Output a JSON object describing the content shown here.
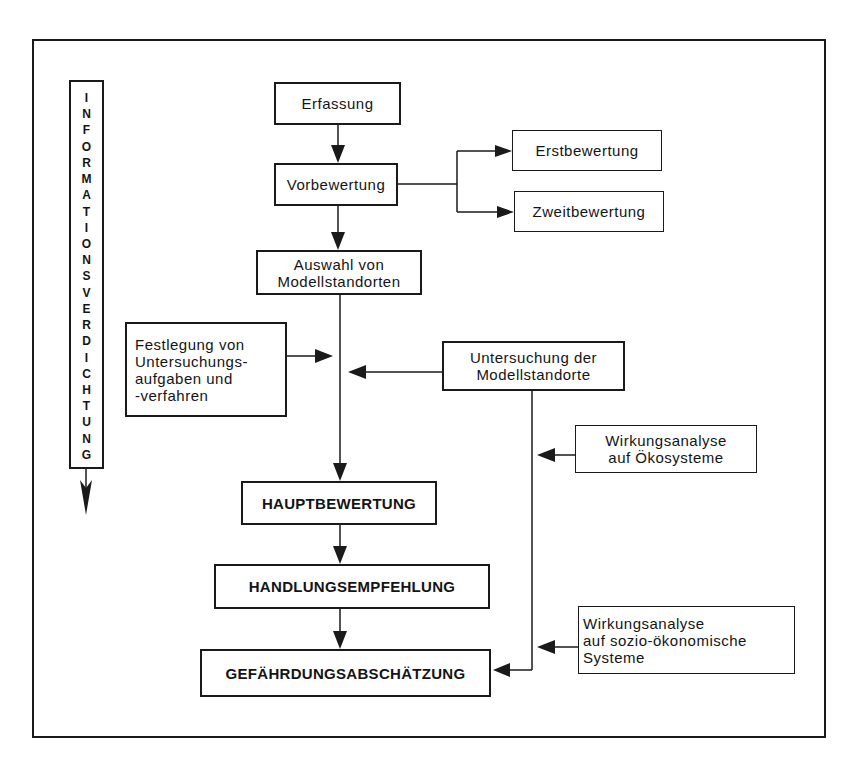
{
  "diagram": {
    "type": "flowchart",
    "side_label": "INFORMATIONSVERDICHTUNG",
    "side_label_letters": [
      "I",
      "N",
      "F",
      "O",
      "R",
      "M",
      "A",
      "T",
      "I",
      "O",
      "N",
      "S",
      "V",
      "E",
      "R",
      "D",
      "I",
      "C",
      "H",
      "T",
      "U",
      "N",
      "G"
    ],
    "nodes": {
      "erfassung": "Erfassung",
      "vorbewertung": "Vorbewertung",
      "erstbewertung": "Erstbewertung",
      "zweitbewertung": "Zweitbewertung",
      "auswahl": "Auswahl von\nModellstandorten",
      "festlegung": "Festlegung von\nUntersuchungs-\naufgaben und\n-verfahren",
      "untersuchung": "Untersuchung der\nModellstandorte",
      "wirkung_oeko": "Wirkungsanalyse\nauf Ökosysteme",
      "hauptbewertung": "HAUPTBEWERTUNG",
      "handlung": "HANDLUNGSEMPFEHLUNG",
      "wirkung_sozio": "Wirkungsanalyse\n auf sozio-ökonomische\nSysteme",
      "gefaehrdung": "GEFÄHRDUNGSABSCHÄTZUNG"
    },
    "edges": [
      {
        "from": "Erfassung",
        "to": "Vorbewertung"
      },
      {
        "from": "Vorbewertung",
        "to": "Erstbewertung"
      },
      {
        "from": "Vorbewertung",
        "to": "Zweitbewertung"
      },
      {
        "from": "Vorbewertung",
        "to": "Auswahl von Modellstandorten"
      },
      {
        "from": "Auswahl von Modellstandorten",
        "to": "Hauptbewertung"
      },
      {
        "from": "Festlegung von Untersuchungsaufgaben und -verfahren",
        "to": "main-flow"
      },
      {
        "from": "Untersuchung der Modellstandorte",
        "to": "main-flow"
      },
      {
        "from": "Untersuchung der Modellstandorte",
        "to": "Gefährdungsabschätzung"
      },
      {
        "from": "Wirkungsanalyse auf Ökosysteme",
        "to": "Untersuchung-branch"
      },
      {
        "from": "Wirkungsanalyse auf sozio-ökonomische Systeme",
        "to": "Untersuchung-branch"
      },
      {
        "from": "Hauptbewertung",
        "to": "Handlungsempfehlung"
      },
      {
        "from": "Handlungsempfehlung",
        "to": "Gefährdungsabschätzung"
      }
    ]
  }
}
